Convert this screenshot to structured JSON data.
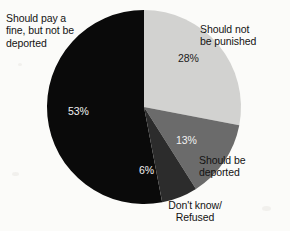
{
  "chart_data": {
    "type": "pie",
    "title": "",
    "subtitle": "",
    "xlabel": "",
    "ylabel": "",
    "legend_position": "callout-labels",
    "grid": false,
    "start_angle_deg": 0,
    "direction": "clockwise",
    "categories": [
      "Should not be punished",
      "Should be deported",
      "Don't know/ Refused",
      "Should pay a fine, but not be deported"
    ],
    "values": [
      28,
      13,
      6,
      53
    ],
    "value_labels": [
      "28%",
      "13%",
      "6%",
      "53%"
    ],
    "colors": [
      "#d2d2d0",
      "#6b6b6b",
      "#2c2c2c",
      "#0a0a0a"
    ],
    "slices": [
      {
        "label": "Should not be punished",
        "label_lines": "Should not\nbe punished",
        "value": 28,
        "value_label": "28%",
        "color": "#d2d2d0",
        "value_text_color": "#1a1a1a"
      },
      {
        "label": "Should be deported",
        "label_lines": "Should be\ndeported",
        "value": 13,
        "value_label": "13%",
        "color": "#6b6b6b",
        "value_text_color": "#f2f2f2"
      },
      {
        "label": "Don't know/ Refused",
        "label_lines": "Don't know/\nRefused",
        "value": 6,
        "value_label": "6%",
        "color": "#2c2c2c",
        "value_text_color": "#f2f2f2"
      },
      {
        "label": "Should pay a fine, but not be deported",
        "label_lines": "Should pay a\nfine, but not be\ndeported",
        "value": 53,
        "value_label": "53%",
        "color": "#0a0a0a",
        "value_text_color": "#f2f2f2"
      }
    ]
  },
  "geometry": {
    "center_x": 144,
    "center_y": 107,
    "radius": 97
  },
  "page": {
    "background_color": "#fbfbf9"
  }
}
